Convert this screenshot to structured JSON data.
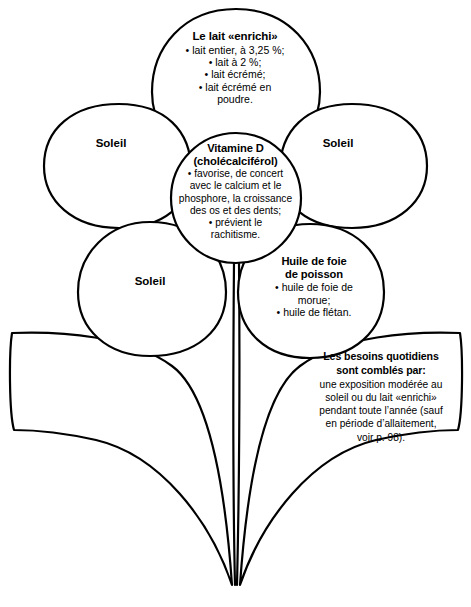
{
  "diagram": {
    "title": "Vitamine D",
    "ink_color": "#000000",
    "background_color": "#ffffff",
    "petals": {
      "milk": {
        "heading": "Le lait «enrichi»",
        "items": [
          "• lait entier, à 3,25 %;",
          "• lait à 2 %;",
          "• lait écrémé;",
          "• lait écrémé en",
          "poudre."
        ]
      },
      "center": {
        "heading_line1": "Vitamine D",
        "heading_line2": "(cholécalciférol)",
        "items": [
          "• favorise, de concert",
          "avec le calcium et le",
          "phosphore, la croissance",
          "des os et des dents;",
          "• prévient le",
          "rachitisme."
        ]
      },
      "fish_oil": {
        "heading_line1": "Huile de foie",
        "heading_line2": "de poisson",
        "items": [
          "• huile de foie de",
          "morue;",
          "• huile de flétan."
        ]
      },
      "sun_left": {
        "label": "Soleil"
      },
      "sun_right": {
        "label": "Soleil"
      },
      "sun_bottom": {
        "label": "Soleil"
      }
    },
    "leaf_note": {
      "heading_line1": "Les besoins quotidiens",
      "heading_line2": "sont comblés par:",
      "body_lines": [
        "une exposition modérée au",
        "soleil ou du lait «enrichi»",
        "pendant toute l’année (sauf",
        "en période d’allaitement,",
        "voir p. 98)."
      ]
    }
  }
}
